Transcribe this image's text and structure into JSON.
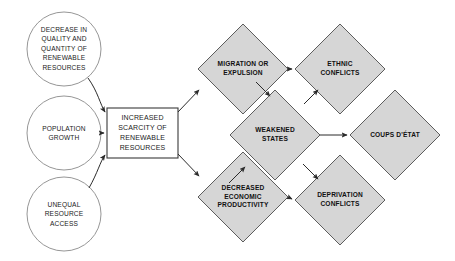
{
  "diagram": {
    "style": {
      "diamond_fill": "#d6d6d6",
      "diamond_stroke": "#4d4d4d",
      "circle_fill": "#ffffff",
      "circle_stroke": "#8a8a8a",
      "box_fill": "#ffffff",
      "box_stroke": "#3a3a3a",
      "arrow_color": "#2b2b2b",
      "background": "#ffffff"
    },
    "nodes": [
      {
        "id": "decrease-quality-quantity",
        "shape": "circle",
        "label": "DECREASE IN\nQUALITY AND\nQUANTITY OF\nRENEWABLE\nRESOURCES",
        "cx": 64,
        "cy": 49,
        "r": 37
      },
      {
        "id": "population-growth",
        "shape": "circle",
        "label": "POPULATION\nGROWTH",
        "cx": 64,
        "cy": 133,
        "r": 37
      },
      {
        "id": "unequal-resource-access",
        "shape": "circle",
        "label": "UNEQUAL\nRESOURCE\nACCESS",
        "cx": 64,
        "cy": 214,
        "r": 37
      },
      {
        "id": "increased-scarcity",
        "shape": "rect",
        "label": "INCREASED\nSCARCITY OF\nRENEWABLE\nRESOURCES",
        "x": 107,
        "y": 108,
        "width": 71,
        "height": 50
      },
      {
        "id": "migration-or-expulsion",
        "shape": "diamond",
        "label": "MIGRATION OR\nEXPULSION",
        "cx": 243,
        "cy": 69,
        "rx": 45,
        "ry": 45
      },
      {
        "id": "ethnic-conflicts",
        "shape": "diamond",
        "label": "ETHNIC\nCONFLICTS",
        "cx": 340,
        "cy": 69,
        "rx": 45,
        "ry": 45
      },
      {
        "id": "weakened-states",
        "shape": "diamond",
        "label": "WEAKENED\nSTATES",
        "cx": 275,
        "cy": 135,
        "rx": 45,
        "ry": 45
      },
      {
        "id": "coups-detat",
        "shape": "diamond",
        "label": "COUPS D'ÉTAT",
        "cx": 395,
        "cy": 135,
        "rx": 45,
        "ry": 45
      },
      {
        "id": "decreased-economic-productivity",
        "shape": "diamond",
        "label": "DECREASED\nECONOMIC\nPRODUCTIVITY",
        "cx": 243,
        "cy": 197,
        "rx": 45,
        "ry": 45
      },
      {
        "id": "deprivation-conflicts",
        "shape": "diamond",
        "label": "DEPRIVATION\nCONFLICTS",
        "cx": 340,
        "cy": 200,
        "rx": 45,
        "ry": 45
      }
    ],
    "edges": [
      {
        "id": "edge-decrease-to-scarcity",
        "from": "decrease-quality-quantity",
        "to": "increased-scarcity"
      },
      {
        "id": "edge-population-to-scarcity",
        "from": "population-growth",
        "to": "increased-scarcity"
      },
      {
        "id": "edge-unequal-to-scarcity",
        "from": "unequal-resource-access",
        "to": "increased-scarcity"
      },
      {
        "id": "edge-scarcity-to-migration",
        "from": "increased-scarcity",
        "to": "migration-or-expulsion"
      },
      {
        "id": "edge-scarcity-to-productivity",
        "from": "increased-scarcity",
        "to": "decreased-economic-productivity"
      },
      {
        "id": "edge-migration-to-ethnic",
        "from": "migration-or-expulsion",
        "to": "ethnic-conflicts"
      },
      {
        "id": "edge-migration-to-weakened",
        "from": "migration-or-expulsion",
        "to": "weakened-states"
      },
      {
        "id": "edge-weakened-to-ethnic",
        "from": "weakened-states",
        "to": "ethnic-conflicts"
      },
      {
        "id": "edge-weakened-to-coups",
        "from": "weakened-states",
        "to": "coups-detat"
      },
      {
        "id": "edge-weakened-to-deprivation",
        "from": "weakened-states",
        "to": "deprivation-conflicts"
      },
      {
        "id": "edge-productivity-to-weakened",
        "from": "decreased-economic-productivity",
        "to": "weakened-states"
      },
      {
        "id": "edge-productivity-to-deprivation",
        "from": "decreased-economic-productivity",
        "to": "deprivation-conflicts"
      }
    ]
  }
}
